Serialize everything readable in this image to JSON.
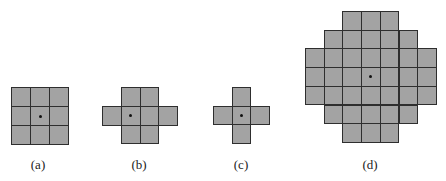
{
  "figure": {
    "colors": {
      "cell_fill": "#a3a3a3",
      "cell_border": "#2e2e2e",
      "origin_dot": "#111111",
      "background": "#ffffff"
    },
    "panels": [
      {
        "id": "a",
        "label": "(a)",
        "cell_size": 19,
        "origin_px": [
          11,
          87
        ],
        "rows": [
          [
            0,
            1,
            2
          ],
          [
            0,
            1,
            2
          ],
          [
            0,
            1,
            2
          ]
        ],
        "dot": [
          1,
          1
        ],
        "label_pos": [
          38,
          157
        ]
      },
      {
        "id": "b",
        "label": "(b)",
        "cell_size": 18.75,
        "origin_px": [
          102,
          87
        ],
        "rows": [
          [
            1,
            2
          ],
          [
            0,
            1,
            2,
            3
          ],
          [
            1,
            2
          ]
        ],
        "dot": [
          1,
          1
        ],
        "label_pos": [
          139,
          157
        ]
      },
      {
        "id": "c",
        "label": "(c)",
        "cell_size": 18.7,
        "origin_px": [
          213,
          87
        ],
        "rows": [
          [
            1
          ],
          [
            0,
            1,
            2
          ],
          [
            1
          ]
        ],
        "dot": [
          1,
          1
        ],
        "label_pos": [
          241,
          157
        ]
      },
      {
        "id": "d",
        "label": "(d)",
        "cell_size": 18.7,
        "origin_px": [
          305,
          11
        ],
        "rows": [
          [
            2,
            3,
            4
          ],
          [
            1,
            2,
            3,
            4,
            5
          ],
          [
            0,
            1,
            2,
            3,
            4,
            5,
            6
          ],
          [
            0,
            1,
            2,
            3,
            4,
            5,
            6
          ],
          [
            0,
            1,
            2,
            3,
            4,
            5,
            6
          ],
          [
            1,
            2,
            3,
            4,
            5
          ],
          [
            2,
            3,
            4
          ]
        ],
        "dot": [
          3,
          3
        ],
        "label_pos": [
          370,
          157
        ]
      }
    ]
  }
}
